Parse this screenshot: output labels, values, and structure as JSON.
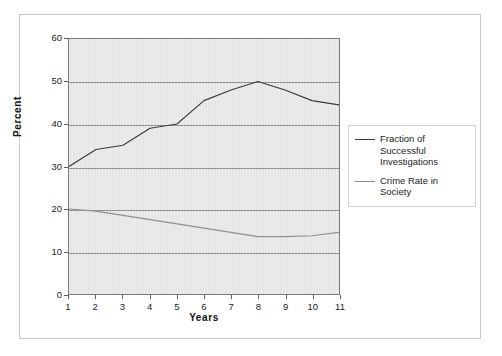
{
  "chart_data": {
    "type": "line",
    "title": "",
    "xlabel": "Years",
    "ylabel": "Percent",
    "x": [
      1,
      2,
      3,
      4,
      5,
      6,
      7,
      8,
      9,
      10,
      11
    ],
    "xtick_labels": [
      "1",
      "2",
      "3",
      "4",
      "5",
      "6",
      "7",
      "8",
      "9",
      "10",
      "11"
    ],
    "ytick_labels": [
      "0",
      "10",
      "20",
      "30",
      "40",
      "50",
      "60"
    ],
    "yticks": [
      0,
      10,
      20,
      30,
      40,
      50,
      60
    ],
    "xlim": [
      1,
      11
    ],
    "ylim": [
      0,
      60
    ],
    "grid": "horizontal",
    "legend_position": "right",
    "series": [
      {
        "name": "Fraction of Successful Investigations",
        "color": "#3a3a3a",
        "values": [
          30,
          34,
          35,
          39,
          40,
          45.5,
          48,
          50,
          48,
          45.5,
          44.5
        ]
      },
      {
        "name": "Crime Rate in Society",
        "color": "#8f8f8f",
        "values": [
          20,
          19.5,
          18.5,
          17.5,
          16.5,
          15.5,
          14.5,
          13.5,
          13.5,
          13.7,
          14.5
        ]
      }
    ]
  },
  "legend": {
    "items": [
      {
        "label": "Fraction of Successful Investigations",
        "swatch": "dark"
      },
      {
        "label": "Crime Rate in Society",
        "swatch": "light"
      }
    ]
  }
}
